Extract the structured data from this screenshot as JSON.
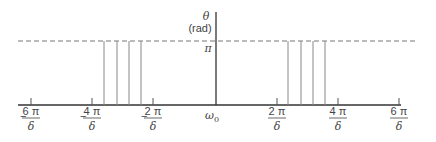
{
  "diagram": {
    "y_axis": {
      "symbol": "θ",
      "unit": "(rad)",
      "level_label": "π"
    },
    "x_axis": {
      "origin_label": "ω",
      "origin_subscript": "0",
      "ticks": [
        {
          "sign": "−",
          "num": "6 π",
          "den": "δ",
          "x": 31
        },
        {
          "sign": "−",
          "num": "4 π",
          "den": "δ",
          "x": 92
        },
        {
          "sign": "−",
          "num": "2 π",
          "den": "δ",
          "x": 153
        },
        {
          "sign": "",
          "num": "2 π",
          "den": "δ",
          "x": 277
        },
        {
          "sign": "",
          "num": "4 π",
          "den": "δ",
          "x": 338
        },
        {
          "sign": "",
          "num": "6 π",
          "den": "δ",
          "x": 399
        }
      ]
    },
    "impulses_left_x": [
      104,
      117,
      129,
      141
    ],
    "impulses_right_x": [
      288,
      301,
      313,
      325
    ],
    "colors": {
      "axis": "#333333",
      "dash": "#777777",
      "impulse": "#888888"
    }
  }
}
